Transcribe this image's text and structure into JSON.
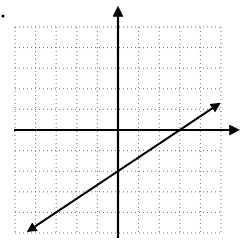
{
  "figure": {
    "bullet_marker": "•",
    "grid": {
      "x_min": -5,
      "x_max": 5,
      "y_min": -5,
      "y_max": 5,
      "spacing": 1,
      "style": "dotted",
      "origin_px": [
        118,
        130
      ],
      "unit_px": 20.6
    },
    "axes": {
      "x_arrow": true,
      "y_arrow": true,
      "color": "#000000"
    },
    "line": {
      "equation": "y = (2/3)x - 2",
      "slope": 0.6667,
      "y_intercept": -2,
      "x_intercept": 3,
      "start": [
        -4.35,
        -4.9
      ],
      "end": [
        4.9,
        1.27
      ],
      "arrows": "both",
      "color": "#000000"
    }
  }
}
